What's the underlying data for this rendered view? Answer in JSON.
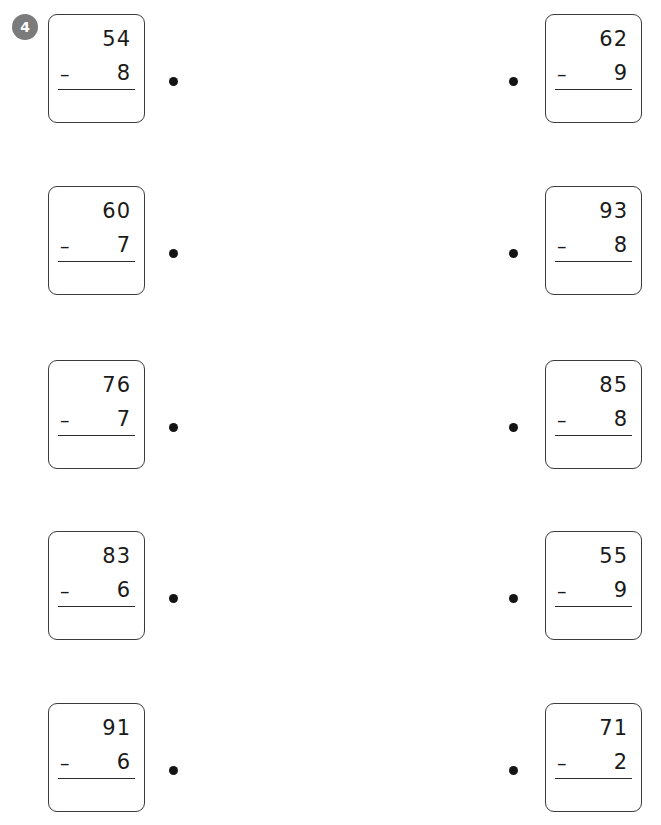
{
  "worksheet": {
    "exercise_number": "4",
    "accent_badge_color": "#7b7b7b",
    "bullet_color": "#141414",
    "card_border_color": "#3b3b3b",
    "operator": "–",
    "rows": [
      {
        "left": {
          "minuend": "54",
          "operator": "–",
          "subtrahend": "8"
        },
        "right": {
          "minuend": "62",
          "operator": "–",
          "subtrahend": "9"
        }
      },
      {
        "left": {
          "minuend": "60",
          "operator": "–",
          "subtrahend": "7"
        },
        "right": {
          "minuend": "93",
          "operator": "–",
          "subtrahend": "8"
        }
      },
      {
        "left": {
          "minuend": "76",
          "operator": "–",
          "subtrahend": "7"
        },
        "right": {
          "minuend": "85",
          "operator": "–",
          "subtrahend": "8"
        }
      },
      {
        "left": {
          "minuend": "83",
          "operator": "–",
          "subtrahend": "6"
        },
        "right": {
          "minuend": "55",
          "operator": "–",
          "subtrahend": "9"
        }
      },
      {
        "left": {
          "minuend": "91",
          "operator": "–",
          "subtrahend": "6"
        },
        "right": {
          "minuend": "71",
          "operator": "–",
          "subtrahend": "2"
        }
      }
    ]
  }
}
